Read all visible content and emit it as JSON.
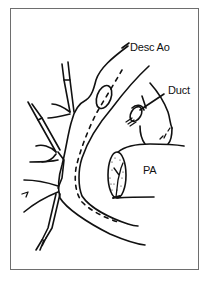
{
  "figure": {
    "labels": {
      "desc_ao": "Desc Ao",
      "duct": "Duct",
      "pa": "PA"
    },
    "colors": {
      "stroke": "#111111",
      "frame": "#6e6e6e",
      "background": "#ffffff"
    }
  }
}
